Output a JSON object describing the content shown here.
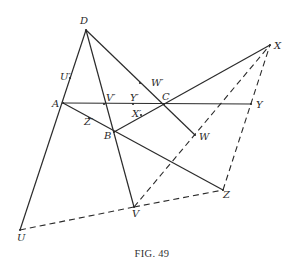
{
  "figure": {
    "caption": "Fig. 49",
    "caption_display": "FIG. 49",
    "colors": {
      "ink": "#2b2b2b",
      "background": "#ffffff"
    }
  },
  "points": {
    "D": {
      "label": "D",
      "x": 86,
      "y": 30,
      "lx": 80,
      "ly": 24
    },
    "X": {
      "label": "X",
      "x": 270,
      "y": 45,
      "lx": 274,
      "ly": 49
    },
    "U1": {
      "label": "U′",
      "x": 70,
      "y": 78,
      "lx": 60,
      "ly": 80
    },
    "W1": {
      "label": "W′",
      "x": 140,
      "y": 83,
      "lx": 151,
      "ly": 86
    },
    "A": {
      "label": "A",
      "x": 63,
      "y": 103,
      "lx": 52,
      "ly": 107
    },
    "V1": {
      "label": "V′",
      "x": 104,
      "y": 104,
      "lx": 106,
      "ly": 101
    },
    "Y1": {
      "label": "Y′",
      "x": 133,
      "y": 104,
      "lx": 130,
      "ly": 101
    },
    "C": {
      "label": "C",
      "x": 164,
      "y": 104,
      "lx": 162,
      "ly": 100
    },
    "Y": {
      "label": "Y",
      "x": 251,
      "y": 104,
      "lx": 256,
      "ly": 108
    },
    "X1": {
      "label": "X′",
      "x": 141,
      "y": 115,
      "lx": 132,
      "ly": 117
    },
    "Z1": {
      "label": "Z′",
      "x": 89,
      "y": 118,
      "lx": 84,
      "ly": 125
    },
    "B": {
      "label": "B",
      "x": 114,
      "y": 132,
      "lx": 104,
      "ly": 139
    },
    "W": {
      "label": "W",
      "x": 195,
      "y": 135,
      "lx": 199,
      "ly": 140
    },
    "Z": {
      "label": "Z",
      "x": 223,
      "y": 190,
      "lx": 223,
      "ly": 198
    },
    "V": {
      "label": "V",
      "x": 134,
      "y": 207,
      "lx": 132,
      "ly": 217
    },
    "U": {
      "label": "U",
      "x": 20,
      "y": 230,
      "lx": 17,
      "ly": 241
    }
  },
  "segments": {
    "solid": [
      [
        "D",
        "U"
      ],
      [
        "D",
        "V"
      ],
      [
        "D",
        "W"
      ],
      [
        "A",
        "Y"
      ],
      [
        "A",
        "Z"
      ],
      [
        "B",
        "X"
      ]
    ],
    "dashed": [
      [
        "U",
        "V"
      ],
      [
        "V",
        "Z"
      ],
      [
        "V",
        "X"
      ],
      [
        "Z",
        "X"
      ]
    ]
  }
}
